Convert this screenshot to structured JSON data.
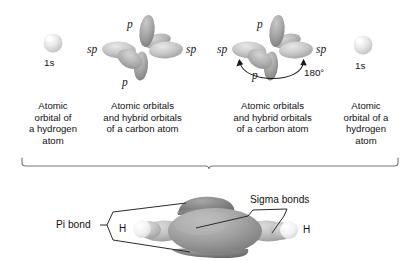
{
  "figure": {
    "title_present": false,
    "background_color": "#ffffff",
    "text_color": "#111111"
  },
  "top_row": {
    "hydrogen_left": {
      "orbital_label": "1s",
      "caption": "Atomic\norbital of\na hydrogen\natom",
      "sphere_color": "#d9d9d9",
      "highlight_color": "#f7f7f7"
    },
    "carbon_left": {
      "labels": {
        "p_top": "p",
        "p_bottom": "p",
        "sp_left": "sp",
        "sp_right": "sp"
      },
      "caption": "Atomic orbitals\nand hybrid orbitals\nof a carbon atom",
      "lobe_color_light": "#cbcbcb",
      "lobe_color_mid": "#a8a8a8",
      "lobe_color_dark": "#8a8a8a"
    },
    "carbon_right": {
      "labels": {
        "p_top": "p",
        "p_bottom": "p",
        "sp_left": "sp",
        "sp_right": "sp"
      },
      "angle_label": "180°",
      "caption": "Atomic orbitals\nand hybrid orbitals\nof a carbon atom",
      "lobe_color_light": "#cbcbcb",
      "lobe_color_mid": "#a8a8a8",
      "lobe_color_dark": "#8a8a8a"
    },
    "hydrogen_right": {
      "orbital_label": "1s",
      "caption": "Atomic\norbital of a\nhydrogen\natom",
      "sphere_color": "#d9d9d9",
      "highlight_color": "#f7f7f7"
    }
  },
  "brace": {
    "color": "#6f6f6f",
    "description": "horizontal brace spanning all four top captions"
  },
  "molecule": {
    "pi_bond_label": "Pi bond",
    "sigma_bonds_label": "Sigma bonds",
    "hydrogen_left_label": "H",
    "hydrogen_right_label": "H",
    "colors": {
      "pi_lobe": "#7c7c7c",
      "sigma_core": "#9a9a9a",
      "sp_lobe": "#b4b4b4",
      "hydrogen": "#eeeeee",
      "leader_line": "#2a2a2a"
    }
  }
}
